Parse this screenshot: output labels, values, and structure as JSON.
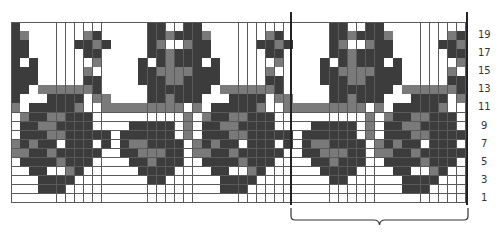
{
  "chart": {
    "columns": 50,
    "rows": 20,
    "repeat_width": 20,
    "repeat_start_column": 31,
    "colors": {
      "0": "#ffffff",
      "1": "#3c3c3c",
      "2": "#7a7a7a"
    },
    "row_labels": [
      "19",
      "17",
      "15",
      "13",
      "11",
      "9",
      "7",
      "5",
      "3",
      "1"
    ],
    "repeat_rows_top_to_bottom": [
      "00000110011000000000",
      "00000112111200000021",
      "10000120021100000112",
      "00000112111100000011",
      "00001012111010000002",
      "00001122221110000020",
      "00001112211110000011",
      "00000111111102222221",
      "20000112111000111102",
      "22222222202011111200",
      "00000000020211221110",
      "00011111020112211110",
      "10111111020111221111",
      "10122111102121101110",
      "00112221102211211111",
      "00011211100111121110",
      "00001111000011002100",
      "00000110000001111000",
      "00000000000001110000",
      "00000000000000000000"
    ]
  }
}
